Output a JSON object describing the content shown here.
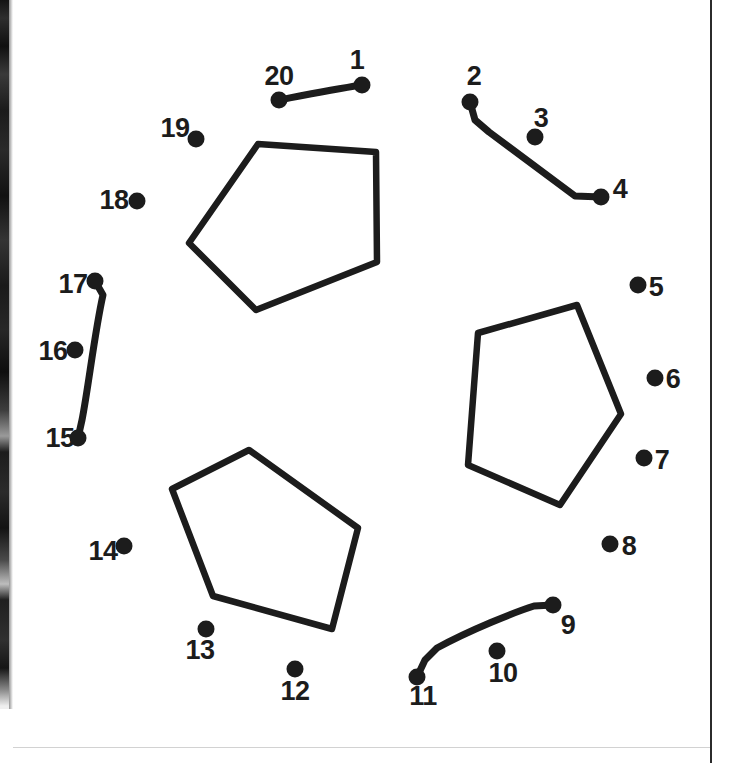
{
  "page": {
    "kind": "connect-the-dots-puzzle",
    "width": 733,
    "height": 763,
    "background_color": "#ffffff",
    "ink_color": "#1c1c1c"
  },
  "dots": [
    {
      "number": "1",
      "x": 362,
      "y": 85,
      "label_x": 357,
      "label_y": 60
    },
    {
      "number": "2",
      "x": 470,
      "y": 102,
      "label_x": 474,
      "label_y": 76
    },
    {
      "number": "3",
      "x": 535,
      "y": 137,
      "label_x": 541,
      "label_y": 118
    },
    {
      "number": "4",
      "x": 601,
      "y": 197,
      "label_x": 620,
      "label_y": 189
    },
    {
      "number": "5",
      "x": 638,
      "y": 285,
      "label_x": 656,
      "label_y": 287
    },
    {
      "number": "6",
      "x": 655,
      "y": 378,
      "label_x": 673,
      "label_y": 379
    },
    {
      "number": "7",
      "x": 644,
      "y": 458,
      "label_x": 662,
      "label_y": 460
    },
    {
      "number": "8",
      "x": 610,
      "y": 544,
      "label_x": 629,
      "label_y": 546
    },
    {
      "number": "9",
      "x": 553,
      "y": 605,
      "label_x": 568,
      "label_y": 625
    },
    {
      "number": "10",
      "x": 497,
      "y": 651,
      "label_x": 503,
      "label_y": 673
    },
    {
      "number": "11",
      "x": 417,
      "y": 677,
      "label_x": 423,
      "label_y": 696
    },
    {
      "number": "12",
      "x": 295,
      "y": 669,
      "label_x": 295,
      "label_y": 691
    },
    {
      "number": "13",
      "x": 206,
      "y": 629,
      "label_x": 200,
      "label_y": 650
    },
    {
      "number": "14",
      "x": 124,
      "y": 546,
      "label_x": 103,
      "label_y": 551
    },
    {
      "number": "15",
      "x": 78,
      "y": 438,
      "label_x": 60,
      "label_y": 438
    },
    {
      "number": "16",
      "x": 75,
      "y": 350,
      "label_x": 53,
      "label_y": 351
    },
    {
      "number": "17",
      "x": 95,
      "y": 281,
      "label_x": 73,
      "label_y": 284
    },
    {
      "number": "18",
      "x": 137,
      "y": 201,
      "label_x": 114,
      "label_y": 200
    },
    {
      "number": "19",
      "x": 196,
      "y": 139,
      "label_x": 175,
      "label_y": 128
    },
    {
      "number": "20",
      "x": 279,
      "y": 100,
      "label_x": 279,
      "label_y": 76
    }
  ],
  "drawn_segments": [
    {
      "name": "segment-20-to-1",
      "path": "M 279 100 C 300 96, 330 90, 362 85"
    },
    {
      "name": "segment-2-to-4",
      "path": "M 470 102 L 475 120 L 489 132 L 575 196 L 601 197"
    },
    {
      "name": "segment-17-to-15",
      "path": "M 95 281 L 103 295 C 95 330, 88 390, 82 420 L 78 438"
    },
    {
      "name": "segment-11-to-9",
      "path": "M 417 677 L 425 660 L 437 648 C 470 630, 515 612, 534 606 L 553 605"
    }
  ],
  "outline_shapes": [
    {
      "name": "shape-top-pentagon",
      "points": "258,144 376,152 377,262 256,310 189,243"
    },
    {
      "name": "shape-right-pentagon",
      "points": "478,333 577,305 621,414 560,505 468,465"
    },
    {
      "name": "shape-bottom-left-pentagon",
      "points": "249,450 358,528 332,629 213,596 172,489"
    }
  ]
}
